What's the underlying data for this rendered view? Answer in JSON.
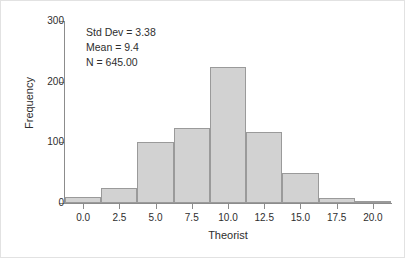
{
  "chart_data": {
    "type": "bar",
    "chart_subtype": "histogram",
    "title": "",
    "xlabel": "Theorist",
    "ylabel": "Frequency",
    "xlim": [
      -1.25,
      21.25
    ],
    "ylim": [
      0,
      300
    ],
    "grid": false,
    "legend": null,
    "bin_width": 2.5,
    "bin_starts": [
      -1.25,
      1.25,
      3.75,
      6.25,
      8.75,
      11.25,
      13.75,
      16.25,
      18.75
    ],
    "bin_centers": [
      0.0,
      2.5,
      5.0,
      7.5,
      10.0,
      12.5,
      15.0,
      17.5,
      20.0
    ],
    "categories": [
      "0.0",
      "2.5",
      "5.0",
      "7.5",
      "10.0",
      "12.5",
      "15.0",
      "17.5",
      "20.0"
    ],
    "values": [
      10,
      25,
      100,
      123,
      224,
      117,
      50,
      8,
      2
    ],
    "xticks": [
      0.0,
      2.5,
      5.0,
      7.5,
      10.0,
      12.5,
      15.0,
      17.5,
      20.0
    ],
    "xtick_labels": [
      "0.0",
      "2.5",
      "5.0",
      "7.5",
      "10.0",
      "12.5",
      "15.0",
      "17.5",
      "20.0"
    ],
    "yticks": [
      0,
      100,
      200,
      300
    ],
    "ytick_labels": [
      "0",
      "100",
      "200",
      "300"
    ],
    "annotations": [
      "Std Dev = 3.38",
      "Mean = 9.4",
      "N = 645.00"
    ],
    "stats": {
      "std_dev": "3.38",
      "mean": "9.4",
      "n": "645.00"
    },
    "colors": {
      "bar_fill": "#d2d2d2",
      "bar_edge": "#9a9a9a",
      "axis": "#8c8c8c",
      "text": "#2e2e2e",
      "background": "#ffffff"
    }
  }
}
